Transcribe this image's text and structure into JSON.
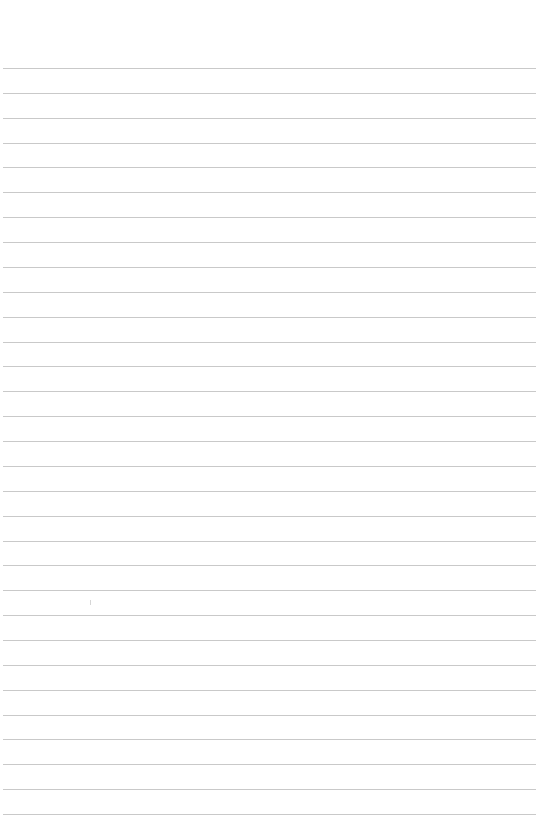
{
  "page": {
    "type": "lined-paper",
    "background": "#ffffff",
    "rule_color": "#c9c9c9",
    "rule_count": 31,
    "first_rule_y": 68,
    "rule_spacing": 24.87,
    "rule_left": 3
  },
  "text": []
}
